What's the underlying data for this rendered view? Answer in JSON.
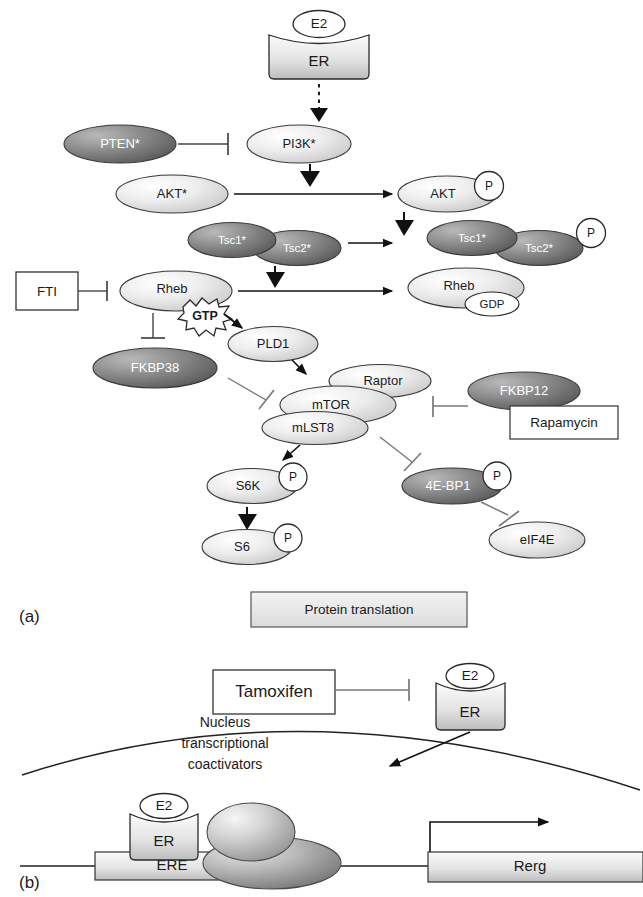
{
  "figure": {
    "panels": [
      {
        "id": "a",
        "label": "(a)"
      },
      {
        "id": "b",
        "label": "(b)"
      }
    ],
    "background_color": "#ffffff",
    "line_color": "#1a1a1a",
    "light_fill": "#e8e8e8",
    "dark_fill": "#6e6e6e"
  },
  "panel_a": {
    "receptor": {
      "ligand": "E2",
      "receptor_label": "ER"
    },
    "nodes": [
      {
        "name": "PI3K*",
        "shade": "light",
        "shape": "ellipse"
      },
      {
        "name": "PTEN*",
        "shade": "dark",
        "shape": "ellipse"
      },
      {
        "name": "AKT*",
        "shade": "light",
        "shape": "ellipse"
      },
      {
        "name": "AKT",
        "shade": "light",
        "shape": "ellipse",
        "phospho": "P"
      },
      {
        "name": "Tsc1*",
        "shade": "dark",
        "shape": "ellipse"
      },
      {
        "name": "Tsc2*",
        "shade": "dark",
        "shape": "ellipse"
      },
      {
        "name": "Tsc1*",
        "shade": "dark",
        "shape": "ellipse"
      },
      {
        "name": "Tsc2*",
        "shade": "dark",
        "shape": "ellipse",
        "phospho": "P"
      },
      {
        "name": "Rheb",
        "shade": "light",
        "shape": "ellipse",
        "bound": "GTP"
      },
      {
        "name": "Rheb",
        "shade": "light",
        "shape": "ellipse",
        "bound": "GDP"
      },
      {
        "name": "FKBP38",
        "shade": "dark",
        "shape": "ellipse"
      },
      {
        "name": "PLD1",
        "shade": "light",
        "shape": "ellipse"
      },
      {
        "name": "Raptor",
        "shade": "light",
        "shape": "ellipse"
      },
      {
        "name": "mTOR",
        "shade": "light",
        "shape": "ellipse"
      },
      {
        "name": "mLST8",
        "shade": "light",
        "shape": "ellipse"
      },
      {
        "name": "FKBP12",
        "shade": "dark",
        "shape": "ellipse"
      },
      {
        "name": "S6K",
        "shade": "light",
        "shape": "ellipse",
        "phospho": "P"
      },
      {
        "name": "S6",
        "shade": "light",
        "shape": "ellipse",
        "phospho": "P"
      },
      {
        "name": "4E-BP1",
        "shade": "dark",
        "shape": "ellipse",
        "phospho": "P"
      },
      {
        "name": "eIF4E",
        "shade": "light",
        "shape": "ellipse"
      }
    ],
    "boxes": [
      {
        "name": "FTI",
        "label": "FTI"
      },
      {
        "name": "Rapamycin",
        "label": "Rapamycin"
      },
      {
        "name": "Protein translation",
        "label": "Protein translation"
      }
    ],
    "nucleotides": {
      "gtp": "GTP",
      "gdp": "GDP"
    },
    "phospho_symbol": "P",
    "outcome": "Protein translation"
  },
  "panel_b": {
    "drug_box": "Tamoxifen",
    "receptor": {
      "ligand": "E2",
      "receptor_label": "ER"
    },
    "nucleus_text_lines": [
      "Nucleus",
      "transcriptional",
      "coactivators"
    ],
    "dna_elements": [
      {
        "name": "ERE",
        "label": "ERE"
      },
      {
        "name": "Rerg",
        "label": "Rerg"
      }
    ],
    "bound_receptor": {
      "ligand": "E2",
      "receptor_label": "ER"
    }
  }
}
